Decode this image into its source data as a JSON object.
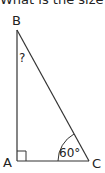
{
  "question": {
    "text": "What is the size of"
  },
  "diagram": {
    "type": "right-triangle",
    "vertices": {
      "A": {
        "label": "A",
        "note": "right angle"
      },
      "B": {
        "label": "B"
      },
      "C": {
        "label": "C"
      }
    },
    "angle_B_label": "?",
    "angle_C_label": "60°",
    "colors": {
      "stroke": "#333333",
      "text": "#222222"
    }
  }
}
